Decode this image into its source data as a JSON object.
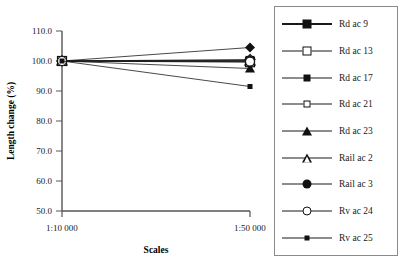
{
  "chart_data": {
    "type": "line",
    "title": "",
    "xlabel": "Scales",
    "ylabel": "Length change (%)",
    "categories": [
      "1:10 000",
      "1:50 000"
    ],
    "xtick_labels": [
      "1:10 000",
      "1:50 000"
    ],
    "ytick_labels": [
      "50.0",
      "60.0",
      "70.0",
      "80.0",
      "90.0",
      "100.0",
      "110.0"
    ],
    "ytick_values": [
      50.0,
      60.0,
      70.0,
      80.0,
      90.0,
      100.0,
      110.0
    ],
    "ylim": [
      50.0,
      110.0
    ],
    "yaxis_step": 10.0,
    "grid": false,
    "legend_position": "right-outside",
    "series": [
      {
        "name": "Rd ac 9",
        "marker": "square-filled",
        "values": [
          100.0,
          100.2
        ]
      },
      {
        "name": "Rd ac 13",
        "marker": "square-open",
        "values": [
          100.0,
          99.6
        ]
      },
      {
        "name": "Rd ac 17",
        "marker": "diamond-filled",
        "values": [
          100.0,
          104.5
        ]
      },
      {
        "name": "Rd ac 21",
        "marker": "diamond-open",
        "values": [
          100.0,
          100.5
        ]
      },
      {
        "name": "Rd ac 23",
        "marker": "triangle-filled",
        "values": [
          100.0,
          97.5
        ]
      },
      {
        "name": "Rail ac 2",
        "marker": "triangle-open",
        "values": [
          100.0,
          100.0
        ]
      },
      {
        "name": "Rail ac 3",
        "marker": "circle-filled",
        "values": [
          100.0,
          100.0
        ]
      },
      {
        "name": "Rv ac 24",
        "marker": "circle-open",
        "values": [
          100.0,
          99.8
        ]
      },
      {
        "name": "Rv ac 25",
        "marker": "square-small",
        "values": [
          100.0,
          91.5
        ]
      }
    ]
  },
  "axes": {
    "ylabel": "Length change (%)",
    "xlabel": "Scales",
    "ytick_labels": [
      "110.0",
      "100.0",
      "90.0",
      "80.0",
      "70.0",
      "60.0",
      "50.0"
    ],
    "xtick_labels": [
      "1:10 000",
      "1:50 000"
    ]
  },
  "legend": {
    "items": [
      {
        "label": "Rd ac 9",
        "marker": "square-filled"
      },
      {
        "label": "Rd ac 13",
        "marker": "square-open"
      },
      {
        "label": "Rd ac 17",
        "marker": "diamond-filled"
      },
      {
        "label": "Rd ac 21",
        "marker": "diamond-open"
      },
      {
        "label": "Rd ac 23",
        "marker": "triangle-filled"
      },
      {
        "label": "Rail ac 2",
        "marker": "triangle-open"
      },
      {
        "label": "Rail ac 3",
        "marker": "circle-filled"
      },
      {
        "label": "Rv ac 24",
        "marker": "circle-open"
      },
      {
        "label": "Rv ac 25",
        "marker": "square-small"
      }
    ]
  },
  "colors": {
    "line": "#1a1a1a",
    "axis": "#555555",
    "legend_border": "#8a8a8a",
    "background": "#ffffff"
  }
}
